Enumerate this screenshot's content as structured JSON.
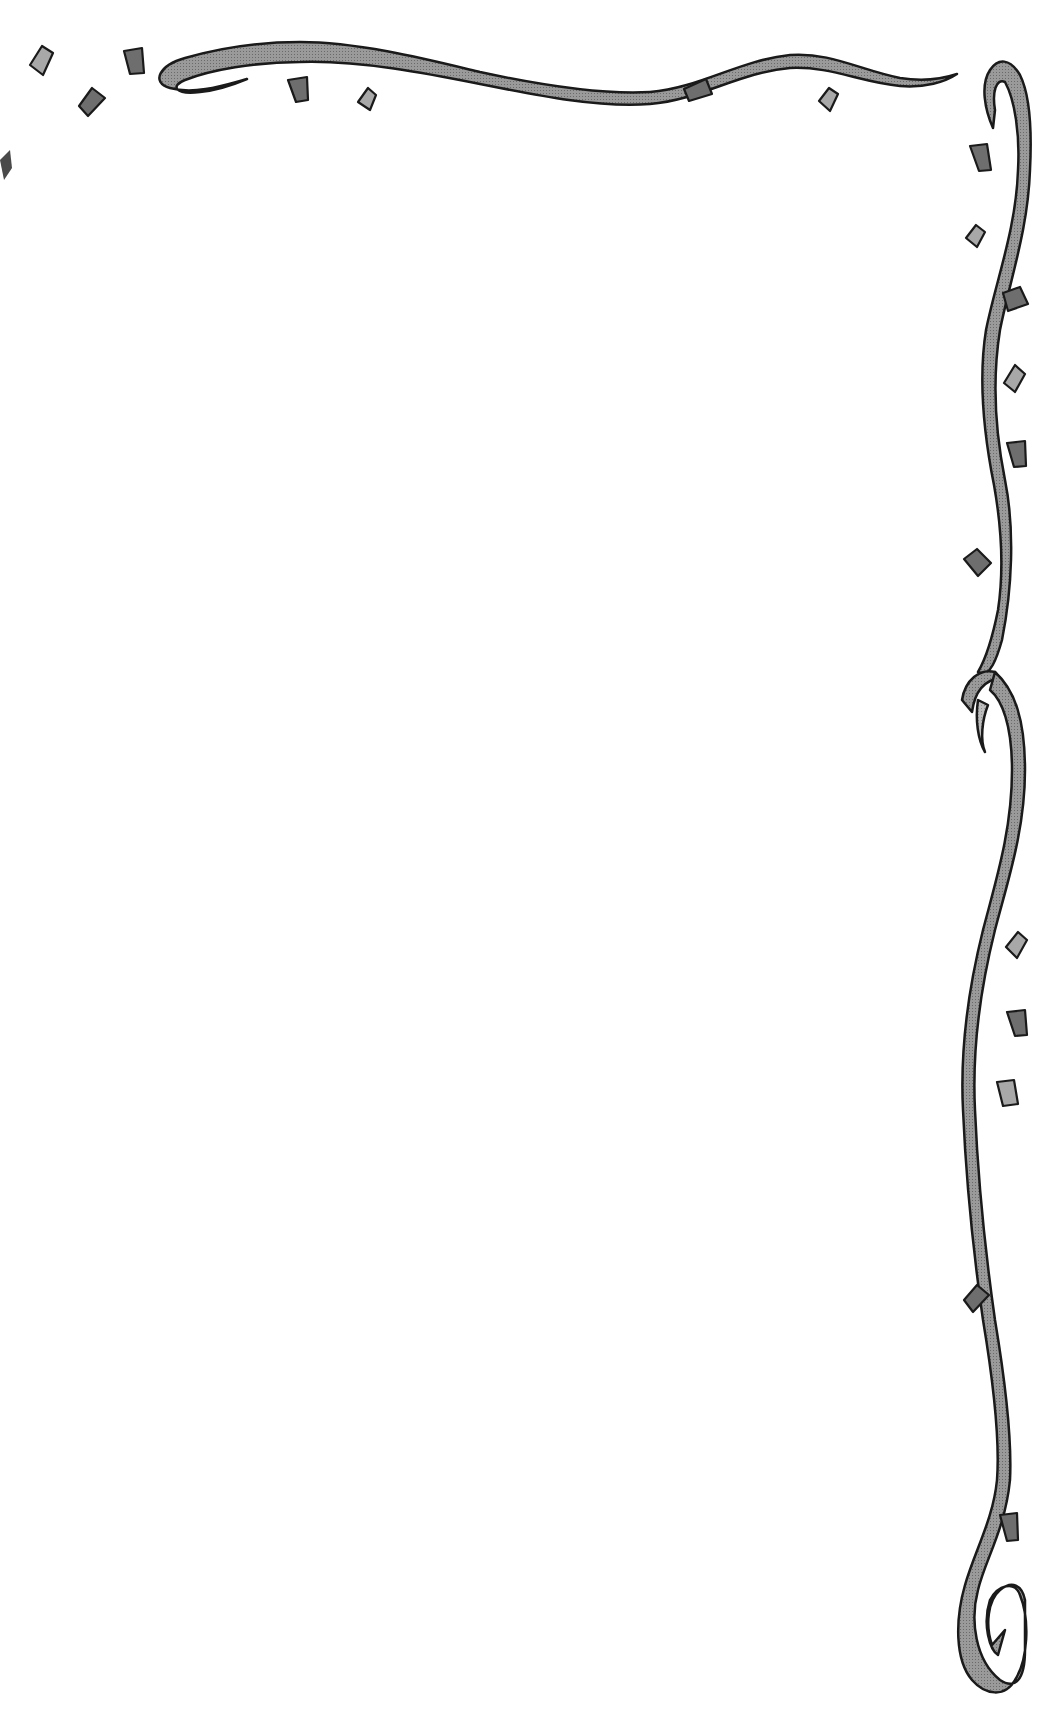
{
  "page": {
    "type": "decorative-stationery",
    "background": "#ffffff",
    "writing_area_text": ""
  },
  "colors": {
    "outline": "#1a1a1a",
    "ribbon_light": "#b4b4b4",
    "ribbon_dark": "#8a8a8a",
    "confetti_dark": "#6e6e6e",
    "confetti_light": "#aaaaaa"
  },
  "decorations": {
    "top_ribbon": "wavy-ribbon-with-curl",
    "right_ribbon": "vertical-wavy-ribbon-with-loop-and-spiral",
    "confetti_count": 22
  }
}
